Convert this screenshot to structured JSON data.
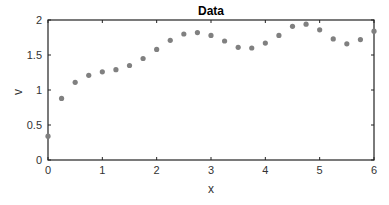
{
  "chart_data": {
    "type": "scatter",
    "title": "Data",
    "xlabel": "x",
    "ylabel": "v",
    "xlim": [
      0,
      6
    ],
    "ylim": [
      0,
      2
    ],
    "xticks": [
      "0",
      "1",
      "2",
      "3",
      "4",
      "5",
      "6"
    ],
    "yticks": [
      "0",
      "0.5",
      "1",
      "1.5",
      "2"
    ],
    "grid": false,
    "marker_color": "#808080",
    "x": [
      0,
      0.25,
      0.5,
      0.75,
      1,
      1.25,
      1.5,
      1.75,
      2,
      2.25,
      2.5,
      2.75,
      3,
      3.25,
      3.5,
      3.75,
      4,
      4.25,
      4.5,
      4.75,
      5,
      5.25,
      5.5,
      5.75,
      6
    ],
    "y": [
      0.34,
      0.88,
      1.11,
      1.21,
      1.26,
      1.29,
      1.35,
      1.45,
      1.58,
      1.71,
      1.8,
      1.82,
      1.78,
      1.7,
      1.61,
      1.6,
      1.67,
      1.78,
      1.91,
      1.94,
      1.86,
      1.73,
      1.66,
      1.72,
      1.84
    ]
  }
}
